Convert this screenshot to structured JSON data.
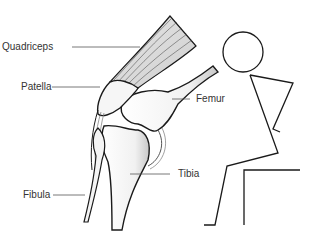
{
  "diagram": {
    "labels": [
      {
        "id": "quadriceps",
        "text": "Quadriceps"
      },
      {
        "id": "patella",
        "text": "Patella"
      },
      {
        "id": "femur",
        "text": "Femur"
      },
      {
        "id": "tibia",
        "text": "Tibia"
      },
      {
        "id": "fibula",
        "text": "Fibula"
      }
    ],
    "colors": {
      "outline": "#1a1a1a",
      "bone_fill": "#f4f4f4",
      "shade": "#bdbdbd",
      "leader": "#555555",
      "text": "#333333"
    }
  }
}
